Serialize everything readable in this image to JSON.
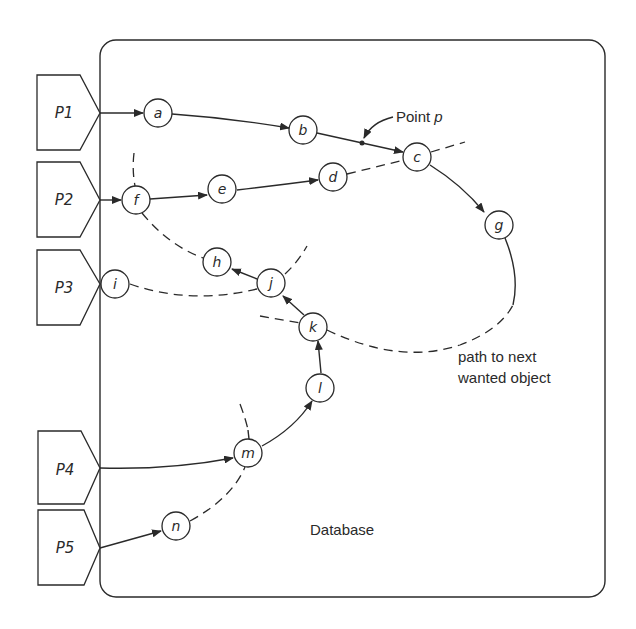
{
  "database": {
    "label": "Database"
  },
  "processes": [
    {
      "id": "P1",
      "label": "P1"
    },
    {
      "id": "P2",
      "label": "P2"
    },
    {
      "id": "P3",
      "label": "P3"
    },
    {
      "id": "P4",
      "label": "P4"
    },
    {
      "id": "P5",
      "label": "P5"
    }
  ],
  "nodes": {
    "a": "a",
    "b": "b",
    "c": "c",
    "d": "d",
    "e": "e",
    "f": "f",
    "g": "g",
    "h": "h",
    "i": "i",
    "j": "j",
    "k": "k",
    "l": "l",
    "m": "m",
    "n": "n"
  },
  "annotations": {
    "point_p": "Point p",
    "point_p_main": "Point ",
    "point_p_var": "p",
    "path_next_line1": "path to next",
    "path_next_line2": "wanted object"
  },
  "colors": {
    "ink": "#2a2a2a",
    "background": "#ffffff"
  }
}
